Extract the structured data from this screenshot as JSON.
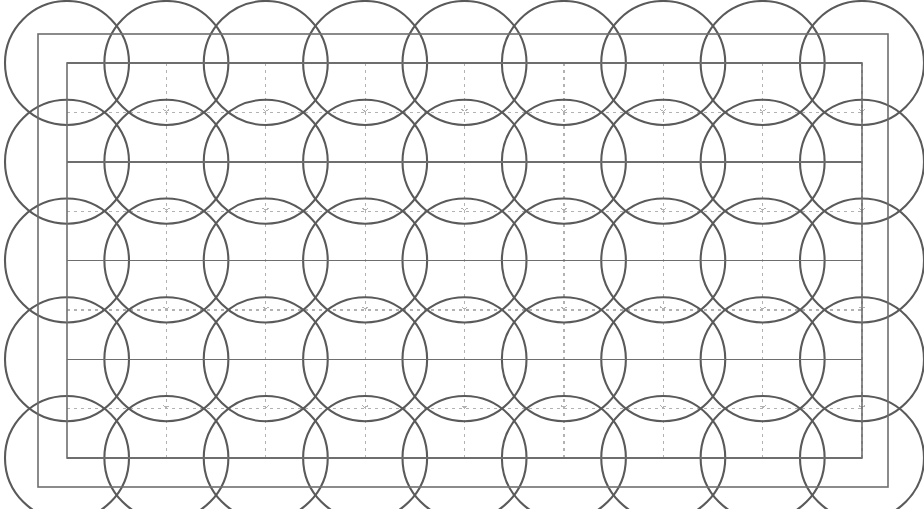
{
  "figure": {
    "title": "Overlapping circle grid construction diagram",
    "canvas": {
      "width": 924,
      "height": 509,
      "background": "#ffffff"
    },
    "outer_frame": {
      "name": "outer-border-rectangle",
      "x": 38,
      "y": 34,
      "width": 850,
      "height": 453,
      "stroke": "#6e6e6e",
      "stroke_width": 1.6,
      "fill": "none"
    },
    "inner_frame": {
      "name": "inner-rectangle",
      "x": 67,
      "y": 63,
      "width": 795,
      "height": 395,
      "stroke": "#6e6e6e",
      "stroke_width": 1.6,
      "fill": "none"
    },
    "grid": {
      "origin_x": 67,
      "origin_y": 63,
      "cell_width": 99.375,
      "cell_height": 98.75,
      "columns": 8,
      "rows": 4,
      "solid_row_lines_y": [
        63,
        161.75,
        260.5,
        359.25,
        458
      ],
      "solid_stroke": "#6e6e6e",
      "solid_stroke_width": 1.5,
      "dotted_vertical_x": [
        166.375,
        265.75,
        365.125,
        464.5,
        563.875,
        663.25,
        762.625,
        862
      ],
      "dotted_horizontal_y": [
        112.375,
        211.125,
        309.875,
        408.625
      ],
      "dotted_stroke": "#b2b2b2",
      "dotted_stroke_width": 1.25,
      "dotted_dasharray": "3 4"
    },
    "circles": {
      "name": "overlapping-circle-lattice",
      "radius": 62,
      "stroke": "#5a5a5a",
      "stroke_width": 2.1,
      "fill": "none",
      "center_x": [
        67,
        166.375,
        265.75,
        365.125,
        464.5,
        563.875,
        663.25,
        762.625,
        862
      ],
      "center_y": [
        63,
        161.75,
        260.5,
        359.25,
        458
      ],
      "columns": 9,
      "rows": 5,
      "count": 45
    },
    "center_ticks": {
      "name": "grid-center-tick-marks",
      "stroke": "#b2b2b2",
      "stroke_width": 1,
      "size": 6
    }
  }
}
